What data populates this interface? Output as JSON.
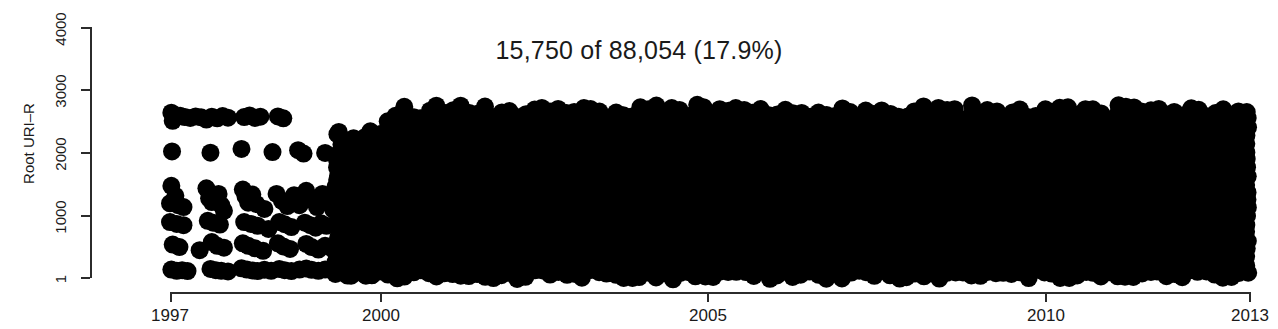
{
  "chart_data": {
    "type": "scatter",
    "title": "15,750 of 88,054 (17.9%)",
    "xlabel": "",
    "ylabel": "Root URI–R",
    "xlim": [
      1997,
      2013
    ],
    "ylim": [
      1,
      4000
    ],
    "x_ticks": [
      1997,
      2000,
      2005,
      2010,
      2013
    ],
    "x_tick_labels": [
      "1997",
      "2000",
      "2005",
      "2010",
      "2013"
    ],
    "y_ticks": [
      1,
      1000,
      2000,
      3000,
      4000
    ],
    "y_tick_labels": [
      "1",
      "1000",
      "2000",
      "3000",
      "4000"
    ],
    "grid": false,
    "legend": null,
    "marker": {
      "shape": "circle",
      "color": "#000000",
      "size_px": 18,
      "filled": true
    },
    "total_count": 88054,
    "plotted_count": 15750,
    "percent": "17.9%",
    "density_band": {
      "x_start": 2000.0,
      "x_end": 2013.0,
      "y_min": 1,
      "y_max": 2780
    },
    "sparse_points": [
      [
        1997.02,
        2630
      ],
      [
        1997.05,
        2560
      ],
      [
        1997.04,
        2500
      ],
      [
        1997.15,
        2580
      ],
      [
        1997.22,
        2560
      ],
      [
        1997.3,
        2545
      ],
      [
        1997.38,
        2570
      ],
      [
        1997.46,
        2555
      ],
      [
        1997.54,
        2520
      ],
      [
        1997.62,
        2565
      ],
      [
        1997.7,
        2540
      ],
      [
        1997.78,
        2575
      ],
      [
        1997.86,
        2550
      ],
      [
        1998.1,
        2560
      ],
      [
        1998.18,
        2585
      ],
      [
        1998.26,
        2545
      ],
      [
        1998.34,
        2565
      ],
      [
        1998.6,
        2570
      ],
      [
        1998.68,
        2540
      ],
      [
        1997.03,
        2010
      ],
      [
        1997.6,
        1990
      ],
      [
        1998.06,
        2050
      ],
      [
        1998.52,
        2000
      ],
      [
        1998.9,
        2030
      ],
      [
        1998.98,
        1975
      ],
      [
        1999.3,
        1985
      ],
      [
        1997.02,
        1460
      ],
      [
        1997.08,
        1300
      ],
      [
        1997.0,
        1180
      ],
      [
        1997.12,
        1150
      ],
      [
        1997.2,
        1120
      ],
      [
        1997.54,
        1420
      ],
      [
        1997.58,
        1260
      ],
      [
        1997.62,
        1200
      ],
      [
        1997.72,
        1330
      ],
      [
        1997.76,
        1150
      ],
      [
        1997.8,
        1060
      ],
      [
        1998.08,
        1400
      ],
      [
        1998.12,
        1290
      ],
      [
        1998.16,
        1190
      ],
      [
        1998.22,
        1320
      ],
      [
        1998.28,
        1170
      ],
      [
        1998.4,
        1090
      ],
      [
        1998.58,
        1330
      ],
      [
        1998.66,
        1220
      ],
      [
        1998.74,
        1135
      ],
      [
        1998.84,
        1310
      ],
      [
        1998.92,
        1150
      ],
      [
        1999.02,
        1380
      ],
      [
        1999.1,
        1240
      ],
      [
        1999.18,
        1120
      ],
      [
        1999.26,
        1330
      ],
      [
        1999.34,
        1200
      ],
      [
        1999.42,
        1080
      ],
      [
        1997.0,
        880
      ],
      [
        1997.1,
        850
      ],
      [
        1997.2,
        830
      ],
      [
        1997.56,
        900
      ],
      [
        1997.64,
        870
      ],
      [
        1997.74,
        840
      ],
      [
        1998.1,
        880
      ],
      [
        1998.2,
        850
      ],
      [
        1998.3,
        820
      ],
      [
        1998.46,
        770
      ],
      [
        1998.62,
        880
      ],
      [
        1998.7,
        845
      ],
      [
        1998.8,
        800
      ],
      [
        1999.0,
        870
      ],
      [
        1999.08,
        830
      ],
      [
        1999.16,
        790
      ],
      [
        1999.24,
        860
      ],
      [
        1999.32,
        820
      ],
      [
        1997.04,
        520
      ],
      [
        1997.14,
        480
      ],
      [
        1997.44,
        430
      ],
      [
        1997.62,
        560
      ],
      [
        1997.7,
        500
      ],
      [
        1997.8,
        470
      ],
      [
        1998.08,
        540
      ],
      [
        1998.16,
        500
      ],
      [
        1998.26,
        460
      ],
      [
        1998.38,
        420
      ],
      [
        1998.6,
        540
      ],
      [
        1998.68,
        490
      ],
      [
        1998.78,
        450
      ],
      [
        1999.02,
        530
      ],
      [
        1999.1,
        480
      ],
      [
        1999.2,
        440
      ],
      [
        1999.3,
        500
      ],
      [
        1999.4,
        460
      ],
      [
        1997.02,
        120
      ],
      [
        1997.1,
        100
      ],
      [
        1997.18,
        110
      ],
      [
        1997.26,
        95
      ],
      [
        1997.6,
        130
      ],
      [
        1997.68,
        110
      ],
      [
        1997.76,
        100
      ],
      [
        1997.86,
        90
      ],
      [
        1998.06,
        140
      ],
      [
        1998.14,
        120
      ],
      [
        1998.22,
        105
      ],
      [
        1998.3,
        95
      ],
      [
        1998.4,
        115
      ],
      [
        1998.5,
        100
      ],
      [
        1998.62,
        130
      ],
      [
        1998.7,
        110
      ],
      [
        1998.8,
        95
      ],
      [
        1998.92,
        120
      ],
      [
        1999.02,
        135
      ],
      [
        1999.1,
        115
      ],
      [
        1999.2,
        100
      ],
      [
        1999.3,
        120
      ],
      [
        1999.4,
        105
      ],
      [
        1999.5,
        95
      ]
    ]
  },
  "axes": {
    "y_title": "Root URI–R",
    "title": "15,750 of 88,054 (17.9%)"
  }
}
